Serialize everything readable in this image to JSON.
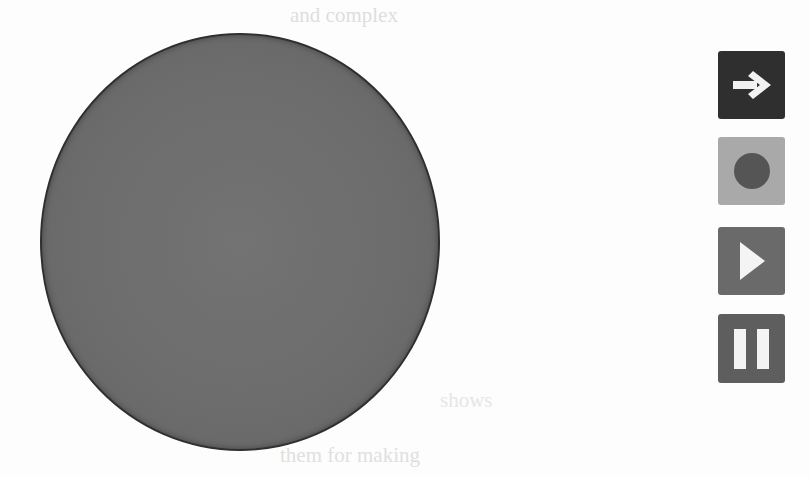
{
  "background": {
    "ghost_text_lines": [
      "and complex",
      "",
      "",
      "",
      "",
      "",
      "",
      "",
      "",
      "",
      "",
      "",
      "",
      "",
      "shows",
      "",
      "them for making"
    ]
  },
  "canvas": {
    "shape": "circle",
    "fill_color": "#6c6c6c",
    "stroke_color": "#2f2f2f"
  },
  "controls": {
    "buttons": [
      {
        "name": "next",
        "icon": "arrow-right-icon",
        "bg_color": "#2f2f2f",
        "icon_color": "#f2f2f2"
      },
      {
        "name": "record",
        "icon": "record-dot-icon",
        "bg_color": "#a9a9a9",
        "icon_color": "#555555"
      },
      {
        "name": "play",
        "icon": "play-icon",
        "bg_color": "#6a6a6a",
        "icon_color": "#f4f4f4"
      },
      {
        "name": "pause",
        "icon": "pause-icon",
        "bg_color": "#5e5e5e",
        "icon_color": "#f4f4f4"
      }
    ]
  }
}
